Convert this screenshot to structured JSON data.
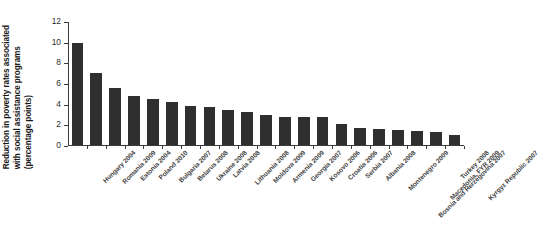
{
  "chart_data": {
    "type": "bar",
    "title": "",
    "xlabel": "",
    "ylabel": "Reduction in poverty rates associated with social assistance programs (percentage points)",
    "ylabel_lines": [
      "Reduction in poverty rates associated",
      "with social assistance programs",
      "(percentage points)"
    ],
    "ylim": [
      0,
      12
    ],
    "ytick_labels": [
      "12",
      "10",
      "8",
      "6",
      "4",
      "2",
      "0"
    ],
    "ytick_values": [
      12,
      10,
      8,
      6,
      4,
      2,
      0
    ],
    "grid": false,
    "legend": false,
    "bar_color": "#2f2f2f",
    "axis_color": "#3b3b3b",
    "categories": [
      "Hungary 2004",
      "Romania 2009",
      "Estonia 2004",
      "Poland 2010",
      "Bulgaria 2007",
      "Belarus 2008",
      "Ukraine 2008",
      "Latvia 2008",
      "Lithuania 2008",
      "Moldova 2009",
      "Armenia 2009",
      "Georgia 2007",
      "Kosovo 2006",
      "Croatia 2006",
      "Serbia 2007",
      "Albania 2008",
      "Montenegro 2009",
      "Bosnia and Herzegovina 2007",
      "Macedonia, FYR 2009",
      "Turkey 2008",
      "Kyrgyz Republic 2007"
    ],
    "values": [
      9.9,
      7.0,
      5.5,
      4.7,
      4.5,
      4.2,
      3.8,
      3.7,
      3.4,
      3.2,
      2.9,
      2.7,
      2.75,
      2.7,
      2.05,
      1.65,
      1.55,
      1.45,
      1.35,
      1.25,
      1.0
    ]
  }
}
